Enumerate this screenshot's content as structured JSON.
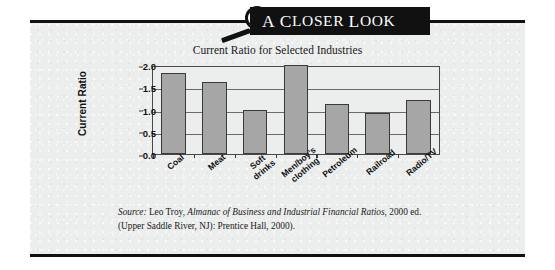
{
  "banner": {
    "title": "A Closer Look",
    "title_parts": [
      "A",
      "C",
      "LOSER",
      "L",
      "OOK"
    ],
    "magnifier_icon": "magnifying-glass-icon",
    "background_color": "#111111",
    "text_color": "#ffffff"
  },
  "panel": {
    "background_color": "#eceded",
    "rule_color": "#111111"
  },
  "chart_data": {
    "type": "bar",
    "title": "Current Ratio for Selected Industries",
    "xlabel": "",
    "ylabel": "Current Ratio",
    "categories": [
      "Coal",
      "Meat",
      "Soft drinks",
      "Men/boy's clothing",
      "Petroleum",
      "Railroad",
      "Radio/TV"
    ],
    "category_lines": [
      [
        "Coal"
      ],
      [
        "Meat"
      ],
      [
        "Soft",
        "drinks"
      ],
      [
        "Men/boy's",
        "clothing"
      ],
      [
        "Petroleum"
      ],
      [
        "Railroad"
      ],
      [
        "Radio/TV"
      ]
    ],
    "values": [
      1.82,
      1.62,
      1.0,
      2.0,
      1.12,
      0.93,
      1.22
    ],
    "ylim": [
      0.0,
      2.0
    ],
    "yticks": [
      "2.0",
      "1.5",
      "1.0",
      "0.5",
      "0.0"
    ],
    "ytick_values": [
      2.0,
      1.5,
      1.0,
      0.5,
      0.0
    ],
    "grid": true,
    "legend": "none",
    "bar_color": "#a6a6a6",
    "bar_border_color": "#3a3a3a"
  },
  "source": {
    "label": "Source:",
    "line1_plain": " Leo Troy, ",
    "line1_italic": "Almanac of Business and Industrial Financial Ratios",
    "line1_tail": ", 2000",
    "line2": "ed. (Upper Saddle River, NJ): Prentice Hall, 2000)."
  }
}
